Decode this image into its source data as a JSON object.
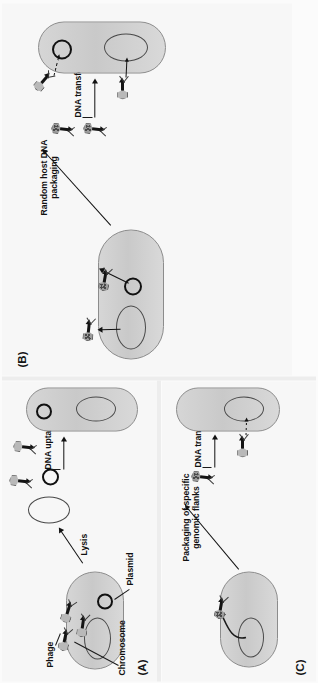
{
  "figure": {
    "background_color": "#fbfbfb",
    "panel_background_color": "#f7f7f7",
    "cell_fill_color": "#d2d2d2",
    "cell_border_color": "#8c8c8c",
    "chromosome_border_color": "#4a4a4a",
    "plasmid_border_color": "#111111",
    "phage_head_color": "#b9b9b9",
    "phage_tail_color": "#141414",
    "text_color": "#111111",
    "orientation": "rotated-90-ccw"
  },
  "panels": [
    {
      "id": "A",
      "label": "(A)",
      "process": "transformation",
      "annotations": [
        {
          "key": "phage",
          "text": "Phage"
        },
        {
          "key": "chromosome",
          "text": "Chromosome"
        },
        {
          "key": "plasmid",
          "text": "Plasmid"
        },
        {
          "key": "lysis",
          "text": "Lysis"
        },
        {
          "key": "uptake",
          "text": "DNA uptake"
        }
      ],
      "donor_cell": {
        "phage_count": 3,
        "has_chromosome": true,
        "has_plasmid": true
      },
      "released_dna": {
        "chromosome": true,
        "plasmid": true
      },
      "free_phages": 2,
      "recipient_cell": {
        "has_chromosome": true,
        "has_plasmid": true
      }
    },
    {
      "id": "B",
      "label": "(B)",
      "process": "generalized transduction",
      "annotations": [
        {
          "key": "packaging",
          "text": "Random host DNA packaging"
        },
        {
          "key": "transfer",
          "text": "DNA transfer"
        }
      ],
      "donor_cell": {
        "phage_count": 2,
        "has_chromosome": true,
        "has_plasmid": true
      },
      "free_phages": 2,
      "recipient_cell": {
        "has_chromosome": true,
        "has_plasmid": true,
        "injecting_phages": 2
      }
    },
    {
      "id": "C",
      "label": "(C)",
      "process": "specialized transduction",
      "annotations": [
        {
          "key": "packaging",
          "text": "Packaging of specific genomic flanks"
        },
        {
          "key": "transfer",
          "text": "DNA transfer"
        }
      ],
      "donor_cell": {
        "phage_count": 1,
        "has_chromosome": true,
        "has_plasmid": false
      },
      "free_phages": 1,
      "recipient_cell": {
        "has_chromosome": true,
        "has_plasmid": false,
        "injecting_phages": 1
      }
    }
  ]
}
